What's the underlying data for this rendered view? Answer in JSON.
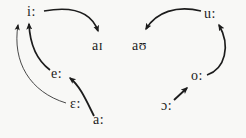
{
  "diagram": {
    "type": "vowel-shift-diagram",
    "colors": {
      "ink": "#1c1c1c",
      "background": "#f8f8f6"
    },
    "vowels": [
      {
        "id": "i-long",
        "label": "i:"
      },
      {
        "id": "ai-diph",
        "label": "aɪ"
      },
      {
        "id": "au-diph",
        "label": "aʊ"
      },
      {
        "id": "u-long",
        "label": "u:"
      },
      {
        "id": "e-long",
        "label": "e:"
      },
      {
        "id": "eps-long",
        "label": "ɛ:"
      },
      {
        "id": "a-long",
        "label": "a:"
      },
      {
        "id": "o-long",
        "label": "o:"
      },
      {
        "id": "open-o-long",
        "label": "ɔ:"
      }
    ],
    "shifts": [
      {
        "from": "i:",
        "to": "aɪ",
        "style": "thick-curve"
      },
      {
        "from": "u:",
        "to": "aʊ",
        "style": "thick-curve"
      },
      {
        "from": "e:",
        "to": "i:",
        "style": "thick-curve"
      },
      {
        "from": "ɛ:",
        "to": "i:",
        "style": "thin-curve"
      },
      {
        "from": "a:",
        "to": "e:",
        "style": "thick-curve"
      },
      {
        "from": "ɔ:",
        "to": "o:",
        "style": "straight"
      },
      {
        "from": "o:",
        "to": "u:",
        "style": "thick-curve"
      }
    ]
  }
}
